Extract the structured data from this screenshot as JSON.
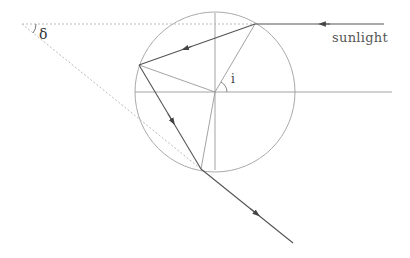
{
  "diagram": {
    "labels": {
      "sunlight": "sunlight",
      "deviation_angle": "δ",
      "incidence_angle": "i"
    },
    "colors": {
      "ray": "#555555",
      "circle": "#aaaaaa",
      "normal": "#999999",
      "dashed": "#bbbbbb",
      "axis": "#999999"
    },
    "geometry": {
      "drop_center": [
        215,
        92
      ],
      "drop_radius": 80,
      "entry_point": [
        255,
        24
      ],
      "reflection_point": [
        139,
        65
      ],
      "exit_point": [
        201,
        169
      ],
      "delta_vertex": [
        22,
        24
      ],
      "incoming_ray_start": [
        384,
        24
      ],
      "outgoing_ray_end": [
        293,
        243
      ],
      "horizontal_axis": [
        [
          135,
          92
        ],
        [
          392,
          92
        ]
      ],
      "vertical_axis": [
        [
          215,
          13
        ],
        [
          215,
          170
        ]
      ]
    },
    "elements": [
      "incoming sunlight ray with arrow",
      "refracted ray inside drop with arrow",
      "internally reflected ray with arrow",
      "exiting ray with arrow",
      "radii (normals) to entry, reflection and exit points",
      "dashed extension lines forming deviation angle δ",
      "angle of incidence i arc"
    ]
  }
}
